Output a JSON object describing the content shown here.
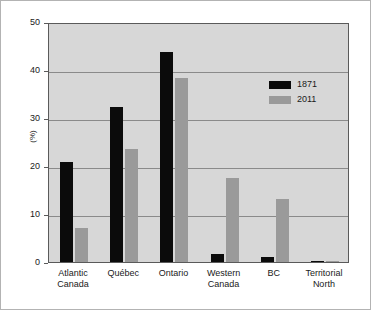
{
  "chart_data": {
    "type": "bar",
    "title": "",
    "subtitle": "",
    "xlabel": "",
    "ylabel": "(%)",
    "ylim": [
      0,
      50
    ],
    "yticks": [
      0,
      10,
      20,
      30,
      40,
      50
    ],
    "ytick_labels": [
      "0",
      "10",
      "20",
      "30",
      "40",
      "50"
    ],
    "grid": true,
    "legend_position": "upper right",
    "categories": [
      "Atlantic\nCanada",
      "Québec",
      "Ontario",
      "Western\nCanada",
      "BC",
      "Territorial\nNorth"
    ],
    "series": [
      {
        "name": "1871",
        "color": "#0b0b0b",
        "values": [
          20.8,
          32.2,
          43.8,
          1.7,
          1.0,
          0.3
        ]
      },
      {
        "name": "2011",
        "color": "#9a9a9a",
        "values": [
          7.0,
          23.5,
          38.4,
          17.6,
          13.1,
          0.3
        ]
      }
    ]
  },
  "style": {
    "plot_background": "#d7d7d7",
    "page_background": "#ffffff",
    "gridline_color": "#8a8a8a",
    "axis_color": "#5a5a5a",
    "border_color": "#b3b3b3",
    "text_color": "#1a1a1a"
  }
}
